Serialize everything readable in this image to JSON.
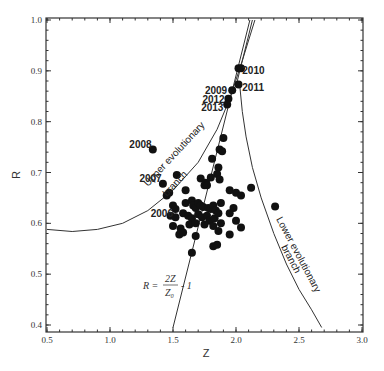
{
  "chart_data": {
    "type": "scatter",
    "title": "",
    "xlabel": "Z",
    "ylabel": "R",
    "xlim": [
      0.5,
      3.0
    ],
    "ylim": [
      0.4,
      1.0
    ],
    "xticks": [
      "0.5",
      "1.0",
      "1.5",
      "2.0",
      "2.5",
      "3.0"
    ],
    "yticks": [
      "0.4",
      "0.5",
      "0.6",
      "0.7",
      "0.8",
      "0.9",
      "1.0"
    ],
    "grid": false,
    "legend": null,
    "annotations": {
      "years": [
        {
          "label": "2010",
          "x": 2.02,
          "y": 0.905
        },
        {
          "label": "2011",
          "x": 2.02,
          "y": 0.873
        },
        {
          "label": "2009",
          "x": 1.97,
          "y": 0.862
        },
        {
          "label": "2012",
          "x": 1.94,
          "y": 0.845
        },
        {
          "label": "2013",
          "x": 1.93,
          "y": 0.834
        },
        {
          "label": "2008",
          "x": 1.34,
          "y": 0.745
        },
        {
          "label": "2007",
          "x": 1.42,
          "y": 0.678
        },
        {
          "label": "2006",
          "x": 1.52,
          "y": 0.625
        }
      ],
      "upper_branch_label": "Upper evolutionary branch",
      "lower_branch_label": "Lower evolutionary branch",
      "formula": {
        "lhs": "R =",
        "num": "2Z",
        "den": "Z₀",
        "rhs": "- 1"
      }
    },
    "series": [
      {
        "name": "observations",
        "points": [
          [
            2.02,
            0.905
          ],
          [
            2.04,
            0.905
          ],
          [
            2.02,
            0.873
          ],
          [
            1.97,
            0.862
          ],
          [
            1.94,
            0.845
          ],
          [
            1.93,
            0.834
          ],
          [
            1.34,
            0.745
          ],
          [
            1.42,
            0.678
          ],
          [
            1.9,
            0.768
          ],
          [
            1.87,
            0.745
          ],
          [
            1.89,
            0.742
          ],
          [
            1.81,
            0.727
          ],
          [
            1.53,
            0.695
          ],
          [
            1.86,
            0.71
          ],
          [
            1.85,
            0.697
          ],
          [
            1.72,
            0.688
          ],
          [
            1.8,
            0.69
          ],
          [
            1.87,
            0.686
          ],
          [
            1.45,
            0.655
          ],
          [
            1.47,
            0.66
          ],
          [
            1.6,
            0.665
          ],
          [
            1.75,
            0.675
          ],
          [
            1.76,
            0.68
          ],
          [
            1.77,
            0.675
          ],
          [
            1.95,
            0.665
          ],
          [
            2.0,
            0.66
          ],
          [
            2.04,
            0.655
          ],
          [
            2.12,
            0.67
          ],
          [
            1.5,
            0.635
          ],
          [
            1.52,
            0.628
          ],
          [
            1.6,
            0.64
          ],
          [
            1.65,
            0.645
          ],
          [
            1.66,
            0.635
          ],
          [
            1.68,
            0.63
          ],
          [
            1.7,
            0.64
          ],
          [
            1.72,
            0.635
          ],
          [
            1.74,
            0.632
          ],
          [
            1.78,
            0.63
          ],
          [
            1.8,
            0.628
          ],
          [
            1.82,
            0.635
          ],
          [
            1.84,
            0.625
          ],
          [
            1.88,
            0.64
          ],
          [
            1.48,
            0.615
          ],
          [
            1.52,
            0.612
          ],
          [
            1.58,
            0.62
          ],
          [
            1.62,
            0.615
          ],
          [
            1.65,
            0.61
          ],
          [
            1.7,
            0.618
          ],
          [
            1.73,
            0.612
          ],
          [
            1.77,
            0.615
          ],
          [
            1.79,
            0.605
          ],
          [
            1.83,
            0.61
          ],
          [
            1.86,
            0.62
          ],
          [
            1.95,
            0.62
          ],
          [
            1.98,
            0.63
          ],
          [
            1.5,
            0.595
          ],
          [
            1.56,
            0.59
          ],
          [
            1.63,
            0.598
          ],
          [
            1.68,
            0.6
          ],
          [
            1.75,
            0.598
          ],
          [
            1.82,
            0.595
          ],
          [
            1.88,
            0.6
          ],
          [
            2.0,
            0.605
          ],
          [
            2.04,
            0.592
          ],
          [
            1.55,
            0.578
          ],
          [
            1.58,
            0.582
          ],
          [
            1.68,
            0.575
          ],
          [
            1.86,
            0.585
          ],
          [
            1.95,
            0.578
          ],
          [
            1.82,
            0.555
          ],
          [
            1.85,
            0.558
          ],
          [
            1.65,
            0.542
          ],
          [
            2.31,
            0.633
          ]
        ]
      }
    ],
    "curves": [
      {
        "name": "upper evolutionary branch",
        "points": [
          [
            0.5,
            0.588
          ],
          [
            0.7,
            0.584
          ],
          [
            0.9,
            0.588
          ],
          [
            1.1,
            0.6
          ],
          [
            1.3,
            0.625
          ],
          [
            1.5,
            0.665
          ],
          [
            1.7,
            0.72
          ],
          [
            1.85,
            0.785
          ],
          [
            1.95,
            0.845
          ],
          [
            2.05,
            0.92
          ],
          [
            2.15,
            1.0
          ]
        ]
      },
      {
        "name": "lower evolutionary branch",
        "points": [
          [
            2.03,
            0.87
          ],
          [
            2.05,
            0.82
          ],
          [
            2.08,
            0.77
          ],
          [
            2.13,
            0.71
          ],
          [
            2.2,
            0.65
          ],
          [
            2.3,
            0.58
          ],
          [
            2.4,
            0.52
          ],
          [
            2.5,
            0.47
          ],
          [
            2.6,
            0.43
          ],
          [
            2.68,
            0.395
          ]
        ]
      },
      {
        "name": "R = 2Z/Z0 - 1",
        "points": [
          [
            1.5,
            0.395
          ],
          [
            2.11,
            1.0
          ]
        ]
      },
      {
        "name": "convergence line",
        "points": [
          [
            2.0,
            0.87
          ],
          [
            2.13,
            1.0
          ]
        ]
      }
    ]
  }
}
